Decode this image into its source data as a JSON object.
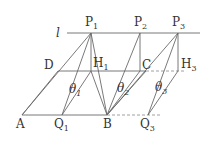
{
  "diagram": {
    "line_label": "l",
    "points": {
      "P1": {
        "label": "P",
        "sub": "1"
      },
      "P2": {
        "label": "P",
        "sub": "2"
      },
      "P3": {
        "label": "P",
        "sub": "3"
      },
      "D": {
        "label": "D"
      },
      "H1": {
        "label": "H",
        "sub": "1"
      },
      "C": {
        "label": "C"
      },
      "H3": {
        "label": "H",
        "sub": "3"
      },
      "A": {
        "label": "A"
      },
      "Q1": {
        "label": "Q",
        "sub": "1"
      },
      "B": {
        "label": "B"
      },
      "Q3": {
        "label": "Q",
        "sub": "3"
      }
    },
    "angles": {
      "theta1": {
        "label": "θ",
        "sub": "1"
      },
      "theta2": {
        "label": "θ",
        "sub": "2"
      },
      "theta3": {
        "label": "θ",
        "sub": "3"
      }
    }
  }
}
